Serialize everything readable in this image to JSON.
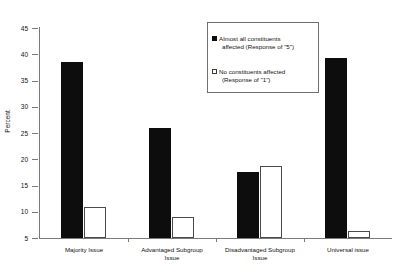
{
  "chart_data": {
    "type": "bar",
    "title": "",
    "subtitle": "",
    "xlabel": "",
    "ylabel": "Percent",
    "ylim": [
      5,
      45
    ],
    "ytick_step": 5,
    "yticks": [
      5,
      10,
      15,
      20,
      25,
      30,
      35,
      40,
      45
    ],
    "grid": false,
    "legend_position": "top-right",
    "categories": [
      "Majority Issue",
      "Advantaged Subgroup Issue",
      "Disadvantaged Subgroup Issue",
      "Universal issue"
    ],
    "category_lines": [
      [
        "Majority Issue"
      ],
      [
        "Advantaged Subgroup",
        "Issue"
      ],
      [
        "Disadvantaged Subgroup",
        "Issue"
      ],
      [
        "Universal issue"
      ]
    ],
    "series": [
      {
        "name": "Almost all constituents affected (Response of \"5\")",
        "legend_line1": "Almost all constituents",
        "legend_line2": "affected (Response of \"5\")",
        "style": "solid",
        "color": "#0d0d0d",
        "values": [
          38.5,
          26.0,
          17.5,
          39.3
        ]
      },
      {
        "name": "No constituents affected (Response of \"1\")",
        "legend_line1": "No constituents affected",
        "legend_line2": "(Response of \"1\")",
        "style": "hollow",
        "color": "#ffffff",
        "values": [
          11.0,
          9.0,
          18.7,
          6.3
        ]
      }
    ]
  }
}
